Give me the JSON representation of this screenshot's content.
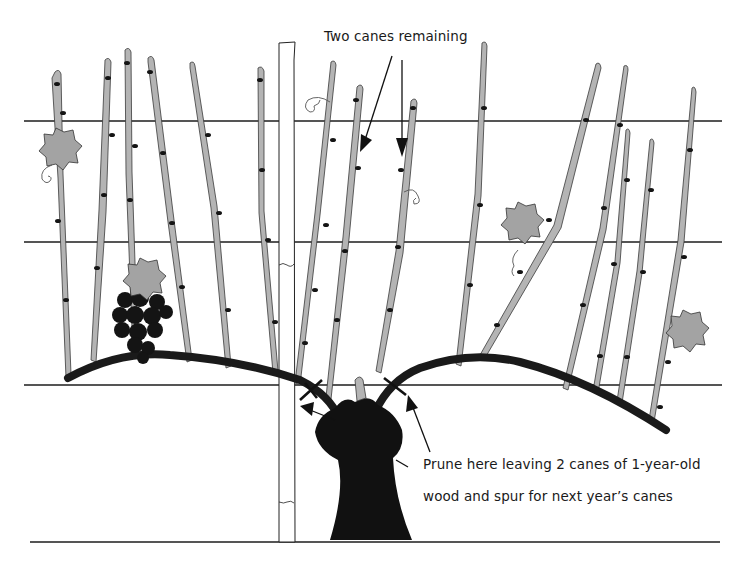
{
  "diagram": {
    "labels": {
      "top_annotation": "Two canes remaining",
      "bottom_annotation_line1": "Prune here leaving 2 canes of 1-year-old",
      "bottom_annotation_line2": "wood and spur for next year’s canes"
    },
    "elements": {
      "trellis_wires": 3,
      "ground_line": 1,
      "post": 1,
      "trunk": 1,
      "cordon_arms": 2,
      "canes_left_arm": 8,
      "canes_right_arm": 7,
      "leaves": 4,
      "grape_clusters": 1,
      "prune_cut_marks": 2,
      "pointer_arrows": 4
    },
    "colors": {
      "ink": "#111111",
      "cane_fill": "#b4b4b4",
      "leaf_fill": "#a3a3a3",
      "background": "#ffffff"
    }
  }
}
